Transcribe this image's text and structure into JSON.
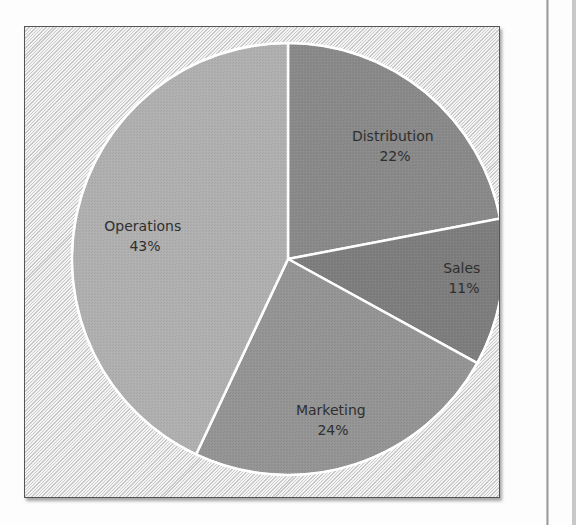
{
  "chart_data": {
    "type": "pie",
    "title": "",
    "start_angle_deg": 0,
    "direction": "clockwise",
    "categories": [
      "Distribution",
      "Sales",
      "Marketing",
      "Operations"
    ],
    "values": [
      22,
      11,
      24,
      43
    ],
    "unit": "%",
    "colors": [
      "#8a8a8a",
      "#7e7e7e",
      "#959595",
      "#b0b0b0"
    ],
    "labels": [
      {
        "name": "Distribution",
        "pct": "22%"
      },
      {
        "name": "Sales",
        "pct": "11%"
      },
      {
        "name": "Marketing",
        "pct": "24%"
      },
      {
        "name": "Operations",
        "pct": "43%"
      }
    ],
    "legend": "none (data labels on slices)",
    "background": "diagonal hatch"
  },
  "slices": [
    {
      "name": "Distribution",
      "pct": "22%"
    },
    {
      "name": "Sales",
      "pct": "11%"
    },
    {
      "name": "Marketing",
      "pct": "24%"
    },
    {
      "name": "Operations",
      "pct": "43%"
    }
  ]
}
